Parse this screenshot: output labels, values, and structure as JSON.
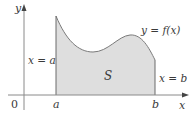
{
  "figure": {
    "colors": {
      "region_fill": "#dedede",
      "curve": "#7a7a7a",
      "axis": "#6a6a6a",
      "text": "#3a3a3a"
    },
    "axes": {
      "y_label": "y",
      "x_label": "x",
      "origin_label": "0"
    },
    "ticks": {
      "a_label": "a",
      "b_label": "b"
    },
    "annotations": {
      "left_bound": "x = a",
      "right_bound": "x = b",
      "curve_label": "y = f(x)",
      "region_label": "S"
    }
  }
}
